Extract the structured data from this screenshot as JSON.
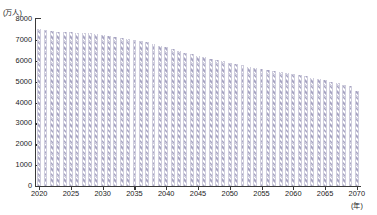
{
  "chart_title": "将来推計人口の推移（総数）",
  "axis": {
    "y_unit": "(万人)",
    "x_unit": "(年)",
    "y_ticks": [
      "0",
      "1000",
      "2000",
      "3000",
      "4000",
      "5000",
      "6000",
      "7000",
      "8000"
    ],
    "x_ticks": [
      "2020",
      "2025",
      "2030",
      "2035",
      "2040",
      "2045",
      "2050",
      "2055",
      "2060",
      "2065",
      "2070"
    ]
  },
  "colors": {
    "bar_hatch": "#a7a4c2",
    "bar_light": "#cecddd",
    "axis": "#3a3a3a",
    "text": "#1a1a1a",
    "background": "#ffffff"
  },
  "chart_data": {
    "type": "bar",
    "title": "将来推計人口の推移（総数）",
    "xlabel": "(年)",
    "ylabel": "(万人)",
    "ylim": [
      0,
      8000
    ],
    "xlim": [
      2020,
      2070
    ],
    "grid": false,
    "legend": "none",
    "unit_note": "万人 = 10,000 persons",
    "categories": [
      2020,
      2021,
      2022,
      2023,
      2024,
      2025,
      2026,
      2027,
      2028,
      2029,
      2030,
      2031,
      2032,
      2033,
      2034,
      2035,
      2036,
      2037,
      2038,
      2039,
      2040,
      2041,
      2042,
      2043,
      2044,
      2045,
      2046,
      2047,
      2048,
      2049,
      2050,
      2051,
      2052,
      2053,
      2054,
      2055,
      2056,
      2057,
      2058,
      2059,
      2060,
      2061,
      2062,
      2063,
      2064,
      2065,
      2066,
      2067,
      2068,
      2069,
      2070
    ],
    "values": [
      7509,
      7450,
      7420,
      7400,
      7385,
      7370,
      7350,
      7330,
      7310,
      7285,
      7250,
      7205,
      7160,
      7110,
      7060,
      7010,
      6950,
      6880,
      6805,
      6720,
      6640,
      6555,
      6470,
      6390,
      6310,
      6240,
      6170,
      6105,
      6040,
      5975,
      5905,
      5840,
      5775,
      5715,
      5660,
      5610,
      5560,
      5510,
      5465,
      5420,
      5370,
      5315,
      5255,
      5195,
      5130,
      5065,
      5000,
      4930,
      4855,
      4780,
      4535
    ],
    "series": [
      {
        "name": "総人口",
        "values": [
          7509,
          7450,
          7420,
          7400,
          7385,
          7370,
          7350,
          7330,
          7310,
          7285,
          7250,
          7205,
          7160,
          7110,
          7060,
          7010,
          6950,
          6880,
          6805,
          6720,
          6640,
          6555,
          6470,
          6390,
          6310,
          6240,
          6170,
          6105,
          6040,
          5975,
          5905,
          5840,
          5775,
          5715,
          5660,
          5610,
          5560,
          5510,
          5465,
          5420,
          5370,
          5315,
          5255,
          5195,
          5130,
          5065,
          5000,
          4930,
          4855,
          4780,
          4535
        ]
      }
    ]
  }
}
